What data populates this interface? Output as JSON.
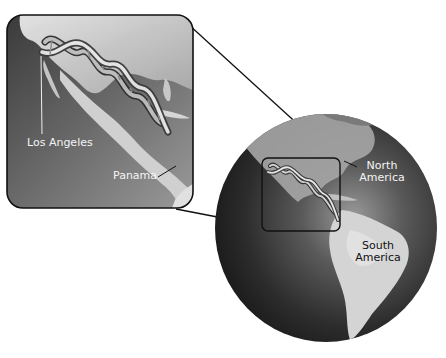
{
  "figure": {
    "colors": {
      "background": "#ffffff",
      "ocean_dark": "#2a2a2a",
      "ocean_mid": "#6e6e6e",
      "land_light": "#cfcfcf",
      "frame_stroke": "#111111",
      "label_light": "#f4f4f4",
      "label_dark": "#111111"
    }
  },
  "inset": {
    "labels": {
      "los_angeles": "Los Angeles",
      "panama": "Panama"
    }
  },
  "globe": {
    "labels": {
      "north_america_line1": "North",
      "north_america_line2": "America",
      "south_america_line1": "South",
      "south_america_line2": "America"
    }
  }
}
